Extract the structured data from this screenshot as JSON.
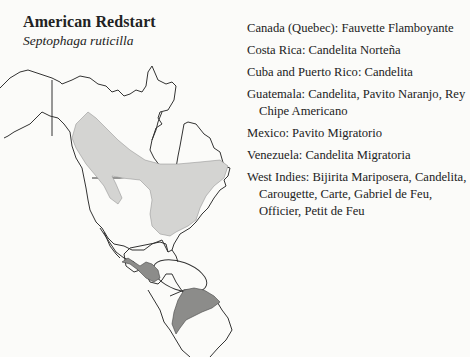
{
  "header": {
    "common_name": "American Redstart",
    "scientific_name": "Septophaga ruticilla"
  },
  "map": {
    "description": "Range map of North, Central and South America",
    "legend": [
      {
        "name": "breeding-range",
        "color": "#d4d4d2"
      },
      {
        "name": "winter-range",
        "color": "#8c8c8a"
      }
    ]
  },
  "local_names": [
    {
      "text": "Canada (Quebec): Fauvette Flamboyante"
    },
    {
      "text": "Costa Rica: Candelita Norteña"
    },
    {
      "text": "Cuba and Puerto Rico: Candelita"
    },
    {
      "text": "Guatemala: Candelita, Pavito Naranjo, Rey Chipe Americano"
    },
    {
      "text": "Mexico: Pavito Migratorio"
    },
    {
      "text": "Venezuela: Candelita Migratoria"
    },
    {
      "text": "West Indies: Bijirita Mariposera, Candelita, Carougette, Carte, Gabriel de Feu, Officier, Petit de Feu"
    }
  ]
}
